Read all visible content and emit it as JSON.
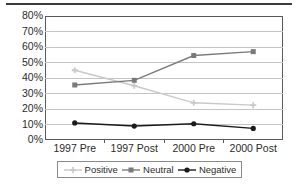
{
  "chart_data": {
    "type": "line",
    "title": "",
    "xlabel": "",
    "ylabel": "",
    "categories": [
      "1997 Pre",
      "1997 Post",
      "2000 Pre",
      "2000 Post"
    ],
    "ylim": [
      0,
      80
    ],
    "ytick_labels": [
      "80%",
      "70%",
      "60%",
      "50%",
      "40%",
      "30%",
      "20%",
      "10%",
      "0%"
    ],
    "ytick_values": [
      80,
      70,
      60,
      50,
      40,
      30,
      20,
      10,
      0
    ],
    "grid": true,
    "legend_position": "bottom",
    "series": [
      {
        "name": "Positive",
        "values": [
          45,
          35,
          24,
          22.5
        ],
        "color": "#c9c9c9",
        "marker": "cross"
      },
      {
        "name": "Neutral",
        "values": [
          35.5,
          38.5,
          54.5,
          57
        ],
        "color": "#7a7a7a",
        "marker": "square"
      },
      {
        "name": "Negative",
        "values": [
          11,
          9,
          10.5,
          7.5
        ],
        "color": "#1a1a1a",
        "marker": "circle"
      }
    ]
  },
  "legend": {
    "items": [
      {
        "label": "Positive"
      },
      {
        "label": "Neutral"
      },
      {
        "label": "Negative"
      }
    ]
  },
  "colors": {
    "positive": "#c9c9c9",
    "neutral": "#7a7a7a",
    "negative": "#1a1a1a",
    "gridline": "#c4c4c4",
    "frame": "#5a5a5a",
    "text": "#2b2b2b",
    "top_rule": "#3a3a3a"
  }
}
